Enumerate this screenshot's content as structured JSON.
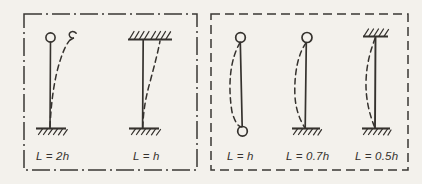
{
  "figure": {
    "background_color": "#f3f1ec",
    "ink_color": "#35322e",
    "panels": [
      {
        "id": "sway-panel",
        "border_style": "dash-dot",
        "columns": [
          {
            "id": "cantilever-column",
            "label": "L = 2h",
            "top_support": "free-pinned-node",
            "bottom_support": "fixed-hatched",
            "buckle_shape": "single-curve-sway-right",
            "effective_length_factor": 2.0
          },
          {
            "id": "fixed-fixed-sway-column",
            "label": "L = h",
            "top_support": "fixed-hatched-sway",
            "bottom_support": "fixed-hatched",
            "buckle_shape": "sway-s-curve-right",
            "effective_length_factor": 1.0
          }
        ]
      },
      {
        "id": "braced-panel",
        "border_style": "dashed",
        "columns": [
          {
            "id": "pinned-pinned-column",
            "label": "L = h",
            "top_support": "pinned-node",
            "bottom_support": "pinned-node",
            "buckle_shape": "half-sine-bow-left",
            "effective_length_factor": 1.0
          },
          {
            "id": "pinned-fixed-column",
            "label": "L = 0.7h",
            "top_support": "pinned-node",
            "bottom_support": "fixed-hatched",
            "buckle_shape": "bow-left-tangent-at-base",
            "effective_length_factor": 0.7
          },
          {
            "id": "fixed-fixed-braced-column",
            "label": "L = 0.5h",
            "top_support": "fixed-hatched",
            "bottom_support": "fixed-hatched",
            "buckle_shape": "double-curvature-bow-left",
            "effective_length_factor": 0.5
          }
        ]
      }
    ]
  }
}
